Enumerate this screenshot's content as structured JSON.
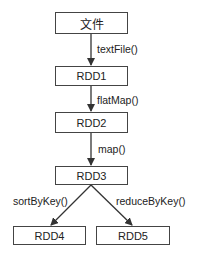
{
  "diagram": {
    "nodes": [
      {
        "id": "file",
        "label": "文件"
      },
      {
        "id": "rdd1",
        "label": "RDD1"
      },
      {
        "id": "rdd2",
        "label": "RDD2"
      },
      {
        "id": "rdd3",
        "label": "RDD3"
      },
      {
        "id": "rdd4",
        "label": "RDD4"
      },
      {
        "id": "rdd5",
        "label": "RDD5"
      }
    ],
    "edges": [
      {
        "from": "file",
        "to": "rdd1",
        "label": "textFile()"
      },
      {
        "from": "rdd1",
        "to": "rdd2",
        "label": "flatMap()"
      },
      {
        "from": "rdd2",
        "to": "rdd3",
        "label": "map()"
      },
      {
        "from": "rdd3",
        "to": "rdd4",
        "label": "sortByKey()"
      },
      {
        "from": "rdd3",
        "to": "rdd5",
        "label": "reduceByKey()"
      }
    ],
    "colors": {
      "stroke": "#444444",
      "text": "#222222",
      "background": "#ffffff"
    }
  }
}
